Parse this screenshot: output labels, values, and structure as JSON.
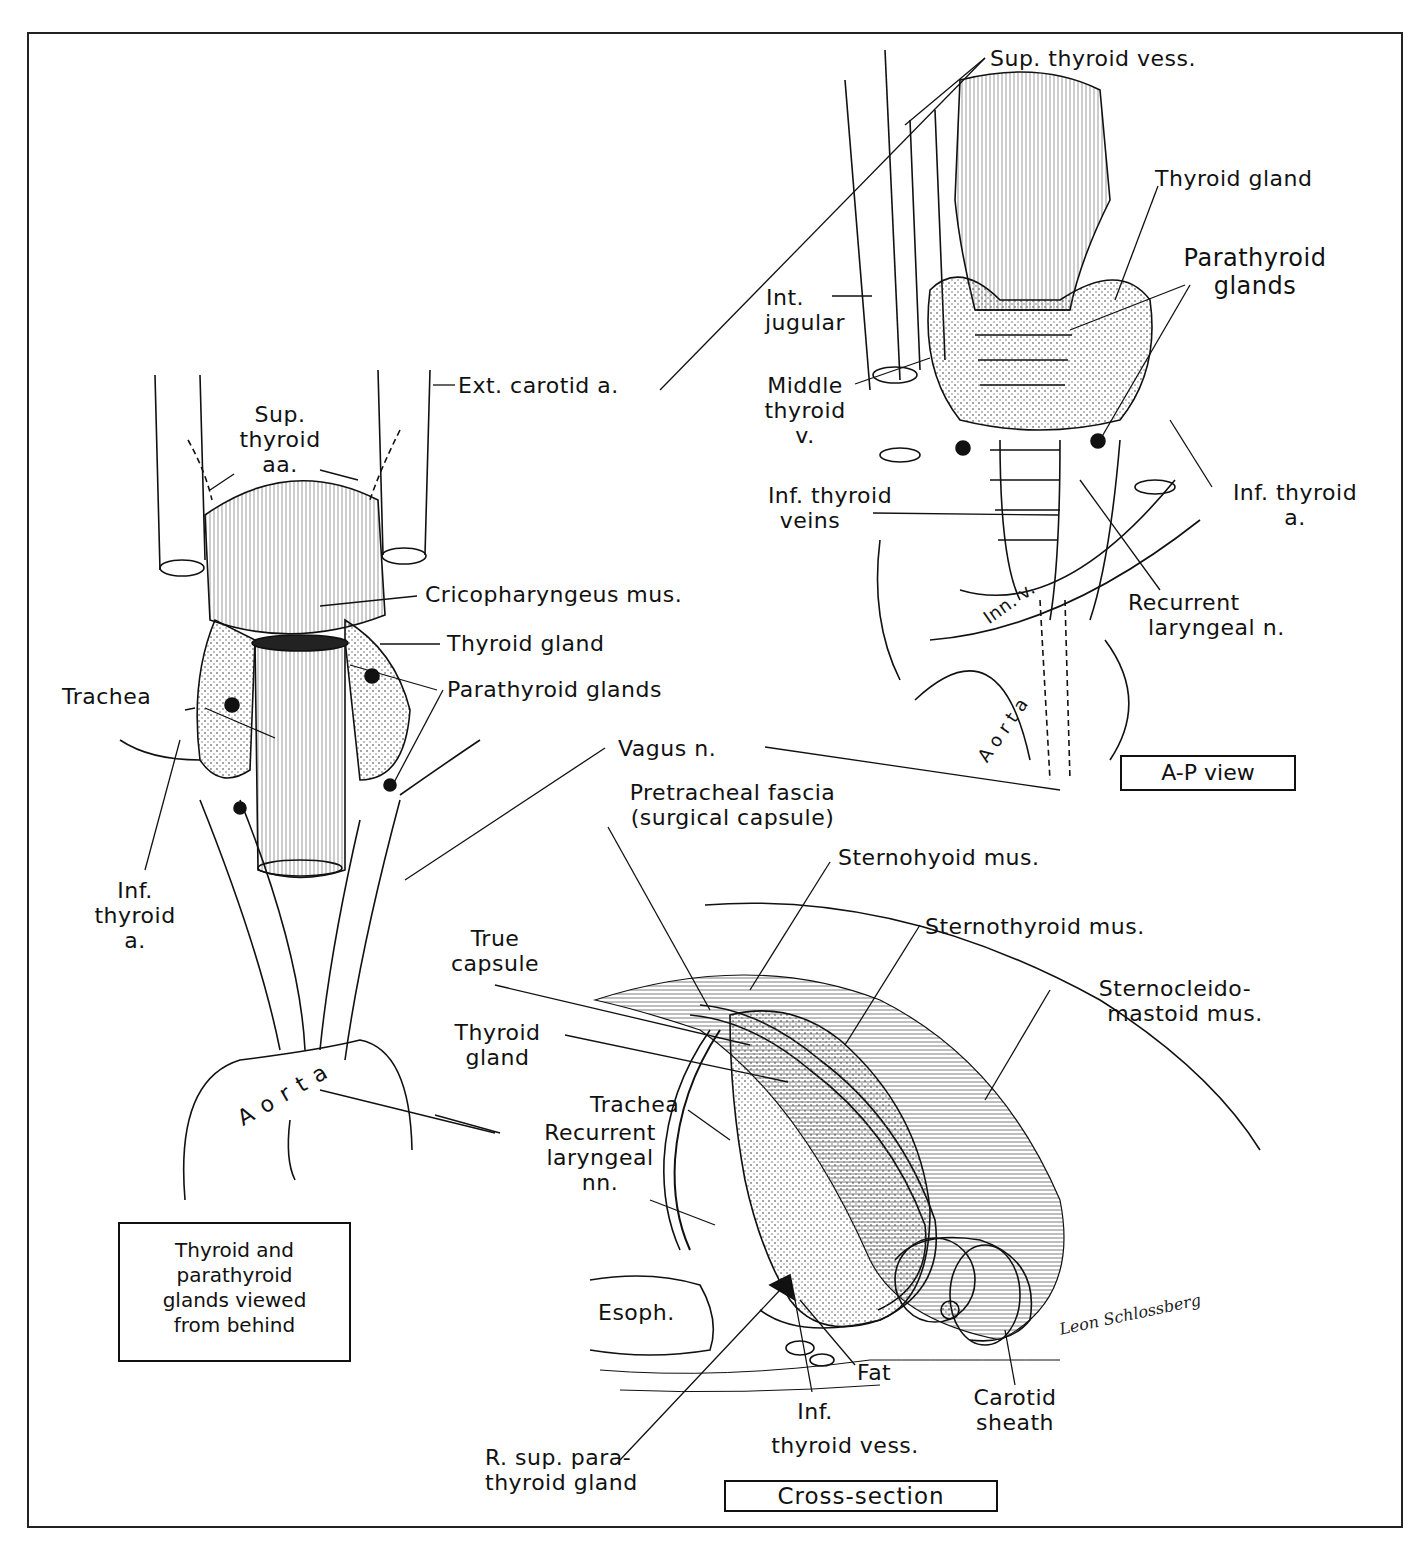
{
  "figure": {
    "title_boxes": {
      "posterior_caption": "Thyroid and parathyroid glands viewed from behind",
      "posterior_caption_lines": [
        "Thyroid and",
        "parathyroid",
        "glands viewed",
        "from behind"
      ],
      "ap_view": "A-P view",
      "cross_section": "Cross-section"
    },
    "signature": "Leon Schlossberg",
    "posterior_view": {
      "labels": {
        "ext_carotid": "Ext. carotid a.",
        "sup_thyroid_aa": [
          "Sup.",
          "thyroid",
          "aa."
        ],
        "cricopharyngeus": "Cricopharyngeus mus.",
        "thyroid_gland": "Thyroid gland",
        "trachea": "Trachea",
        "parathyroid_glands": "Parathyroid glands",
        "vagus": "Vagus n.",
        "inf_thyroid_a": [
          "Inf.",
          "thyroid",
          "a."
        ],
        "aorta": "Aorta",
        "recurrent_laryngeal_nn": [
          "Recurrent",
          "laryngeal",
          "nn."
        ]
      }
    },
    "ap_view": {
      "labels": {
        "sup_thyroid_vess": "Sup. thyroid vess.",
        "thyroid_gland": "Thyroid gland",
        "parathyroid_glands": [
          "Parathyroid",
          "glands"
        ],
        "int_jugular": [
          "Int.",
          "jugular"
        ],
        "middle_thyroid_v": [
          "Middle",
          "thyroid",
          "v."
        ],
        "inf_thyroid_veins": [
          "Inf. thyroid",
          "veins"
        ],
        "inf_thyroid_a": [
          "Inf. thyroid",
          "a."
        ],
        "recurrent_laryngeal_n": [
          "Recurrent",
          "laryngeal n."
        ],
        "inn_v": "Inn. v.",
        "aorta": "Aorta"
      }
    },
    "cross_section": {
      "labels": {
        "pretracheal_fascia": [
          "Pretracheal fascia",
          "(surgical capsule)"
        ],
        "sternohyoid": "Sternohyoid mus.",
        "sternothyroid": "Sternothyroid mus.",
        "sternocleidomastoid": [
          "Sternocleido-",
          "mastoid mus."
        ],
        "true_capsule": [
          "True",
          "capsule"
        ],
        "thyroid_gland": [
          "Thyroid",
          "gland"
        ],
        "trachea": "Trachea",
        "esoph": "Esoph.",
        "fat": "Fat",
        "carotid_sheath": [
          "Carotid",
          "sheath"
        ],
        "inf_thyroid_vess": [
          "Inf.",
          "thyroid vess."
        ],
        "r_sup_parathyroid": [
          "R. sup. para-",
          "thyroid gland"
        ]
      }
    }
  }
}
